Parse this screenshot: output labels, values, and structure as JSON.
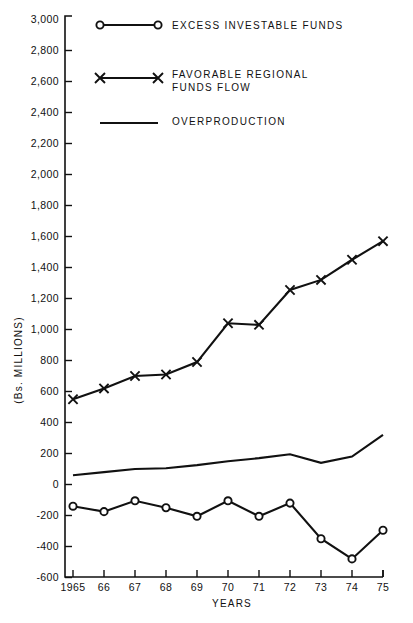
{
  "chart_data": {
    "type": "line",
    "title": "",
    "xlabel": "YEARS",
    "ylabel": "(Bs. MILLIONS)",
    "x": [
      1965,
      1966,
      1967,
      1968,
      1969,
      1970,
      1971,
      1972,
      1973,
      1974,
      1975
    ],
    "xtick_labels": [
      "1965",
      "66",
      "67",
      "68",
      "69",
      "70",
      "71",
      "72",
      "73",
      "74",
      "75"
    ],
    "ytick_labels": [
      "3,000",
      "2,800",
      "2,600",
      "2,400",
      "2,200",
      "2,000",
      "1,800",
      "1,600",
      "1,400",
      "1,200",
      "1,000",
      "800",
      "600",
      "400",
      "200",
      "0",
      "-200",
      "-400",
      "-600"
    ],
    "ytick_values": [
      3000,
      2800,
      2600,
      2400,
      2200,
      2000,
      1800,
      1600,
      1400,
      1200,
      1000,
      800,
      600,
      400,
      200,
      0,
      -200,
      -400,
      -600
    ],
    "ylim": [
      -600,
      3000
    ],
    "xlim": [
      1965,
      1975
    ],
    "grid": false,
    "legend_position": "top-right-inside",
    "series": [
      {
        "name": "EXCESS INVESTABLE FUNDS",
        "marker": "circle",
        "values": [
          -140,
          -175,
          -105,
          -150,
          -205,
          -105,
          -205,
          -120,
          -350,
          -480,
          -295
        ]
      },
      {
        "name": "FAVORABLE REGIONAL FUNDS FLOW",
        "marker": "x",
        "values": [
          550,
          620,
          700,
          710,
          790,
          1040,
          1030,
          1255,
          1320,
          1450,
          1570
        ]
      },
      {
        "name": "OVERPRODUCTION",
        "marker": "none",
        "values": [
          60,
          80,
          100,
          105,
          125,
          150,
          170,
          195,
          140,
          180,
          320
        ]
      }
    ]
  },
  "legend": {
    "entries": [
      {
        "label_lines": [
          "EXCESS  INVESTABLE  FUNDS"
        ],
        "marker": "circle"
      },
      {
        "label_lines": [
          "FAVORABLE   REGIONAL",
          "FUNDS  FLOW"
        ],
        "marker": "x"
      },
      {
        "label_lines": [
          "OVERPRODUCTION"
        ],
        "marker": "none"
      }
    ]
  },
  "colors": {
    "ink": "#111111",
    "background": "#ffffff"
  }
}
